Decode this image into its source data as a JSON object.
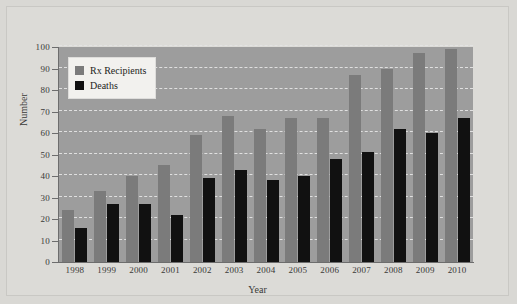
{
  "chart_data": {
    "type": "bar",
    "title": "",
    "xlabel": "Year",
    "ylabel": "Number",
    "categories": [
      "1998",
      "1999",
      "2000",
      "2001",
      "2002",
      "2003",
      "2004",
      "2005",
      "2006",
      "2007",
      "2008",
      "2009",
      "2010"
    ],
    "series": [
      {
        "name": "Rx Recipients",
        "color": "#7b7b7b",
        "values": [
          24,
          33,
          40,
          45,
          59,
          68,
          62,
          67,
          67,
          87,
          90,
          97,
          99
        ]
      },
      {
        "name": "Deaths",
        "color": "#111111",
        "values": [
          16,
          27,
          27,
          22,
          39,
          43,
          38,
          40,
          48,
          51,
          62,
          60,
          67
        ]
      }
    ],
    "ylim": [
      0,
      100
    ],
    "yticks": [
      "0",
      "10",
      "20",
      "30",
      "40",
      "50",
      "60",
      "70",
      "80",
      "90",
      "100"
    ],
    "ytick_values": [
      0,
      10,
      20,
      30,
      40,
      50,
      60,
      70,
      80,
      90,
      100
    ],
    "grid": true,
    "grid_style": "dashed-horizontal",
    "legend_position": "upper-left-inside",
    "plot_background": "#9d9d9d",
    "figure_background": "#dcdbd7"
  },
  "legend": {
    "items": [
      {
        "label": "Rx Recipients",
        "swatch": "rx"
      },
      {
        "label": "Deaths",
        "swatch": "deaths"
      }
    ]
  }
}
